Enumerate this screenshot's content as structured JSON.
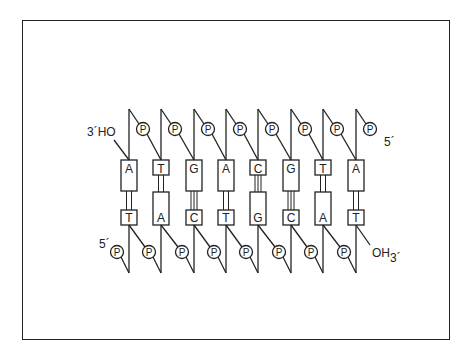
{
  "diagram": {
    "top_strand": {
      "bases": [
        "A",
        "T",
        "G",
        "A",
        "C",
        "G",
        "T",
        "A"
      ],
      "left_end_label": "3´HO",
      "right_end_label": "5´",
      "phosphate_label": "P"
    },
    "bottom_strand": {
      "bases": [
        "T",
        "A",
        "C",
        "T",
        "G",
        "C",
        "A",
        "T"
      ],
      "left_end_label": "5´",
      "right_end_label": "OH",
      "right_end_sublabel": "3´",
      "phosphate_label": "P"
    },
    "pairs": [
      {
        "top": "A",
        "bottom": "T",
        "bonds": 2
      },
      {
        "top": "T",
        "bottom": "A",
        "bonds": 2
      },
      {
        "top": "G",
        "bottom": "C",
        "bonds": 3
      },
      {
        "top": "A",
        "bottom": "T",
        "bonds": 2
      },
      {
        "top": "C",
        "bottom": "G",
        "bonds": 3
      },
      {
        "top": "G",
        "bottom": "C",
        "bonds": 3
      },
      {
        "top": "T",
        "bottom": "A",
        "bonds": 2
      },
      {
        "top": "A",
        "bottom": "T",
        "bonds": 2
      }
    ],
    "colors": {
      "ink": "#222222",
      "background": "#ffffff"
    }
  }
}
